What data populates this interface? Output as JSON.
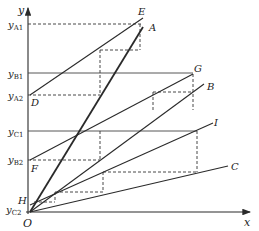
{
  "diagram": {
    "axes": {
      "x_label": "x",
      "y_label": "y",
      "origin_label": "O"
    },
    "y_ticks": [
      {
        "base": "y",
        "sub": "A1",
        "y": 24
      },
      {
        "base": "y",
        "sub": "B1",
        "y": 73
      },
      {
        "base": "y",
        "sub": "A2",
        "y": 95
      },
      {
        "base": "y",
        "sub": "C1",
        "y": 131
      },
      {
        "base": "y",
        "sub": "B2",
        "y": 160
      },
      {
        "base": "y",
        "sub": "C2",
        "y": 210
      }
    ],
    "points": {
      "A": "A",
      "B": "B",
      "C": "C",
      "D": "D",
      "E": "E",
      "F": "F",
      "G": "G",
      "H": "H",
      "I": "I"
    },
    "colors": {
      "line": "#2a2a2a",
      "background": "#ffffff"
    }
  }
}
